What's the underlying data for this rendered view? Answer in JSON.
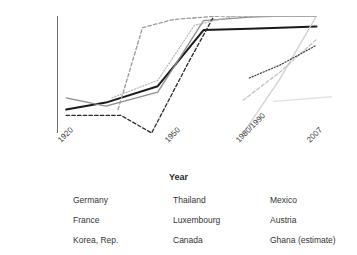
{
  "chart_data": {
    "type": "line",
    "title": "",
    "xlabel": "Year",
    "ylabel": "Coverage %",
    "ylim": [
      0,
      100
    ],
    "yticks": [
      0,
      20,
      40,
      60,
      80,
      100
    ],
    "xticks": [
      "1920",
      "1950",
      "1980/1990",
      "2007"
    ],
    "x": [
      1920,
      1930,
      1940,
      1950,
      1960,
      1970,
      1980,
      1990,
      2000,
      2007
    ],
    "grid": false,
    "legend_position": "bottom",
    "series": [
      {
        "name": "Germany",
        "style": "solid",
        "color": "#1a1a1a",
        "width": 2.0,
        "points": [
          [
            1920,
            20
          ],
          [
            1933,
            26
          ],
          [
            1950,
            40
          ],
          [
            1965,
            88
          ],
          [
            1980,
            89
          ],
          [
            1990,
            90
          ],
          [
            2002,
            91
          ]
        ]
      },
      {
        "name": "France",
        "style": "solid",
        "color": "#8c8c8c",
        "width": 1.3,
        "points": [
          [
            1920,
            30
          ],
          [
            1933,
            23
          ],
          [
            1950,
            35
          ],
          [
            1965,
            96
          ],
          [
            1980,
            99
          ],
          [
            1990,
            100
          ],
          [
            2002,
            100
          ]
        ]
      },
      {
        "name": "Korea, Rep.",
        "style": "solid",
        "color": "#cfcfcf",
        "width": 1.3,
        "points": [
          [
            1978,
            0
          ],
          [
            1990,
            46
          ],
          [
            2002,
            100
          ]
        ]
      },
      {
        "name": "Thailand",
        "style": "dashed",
        "color": "#2b2b2b",
        "width": 1.3,
        "points": [
          [
            1920,
            15
          ],
          [
            1938,
            15
          ],
          [
            1948,
            0
          ],
          [
            1960,
            60
          ],
          [
            1968,
            98
          ]
        ]
      },
      {
        "name": "Luxembourg",
        "style": "dashed",
        "color": "#9a9a9a",
        "width": 1.3,
        "points": [
          [
            1937,
            20
          ],
          [
            1945,
            90
          ],
          [
            1955,
            97
          ],
          [
            1970,
            100
          ],
          [
            2002,
            100
          ]
        ]
      },
      {
        "name": "Canada",
        "style": "dashed",
        "color": "#c2c2c2",
        "width": 1.3,
        "points": [
          [
            1978,
            28
          ],
          [
            1990,
            52
          ],
          [
            2002,
            80
          ]
        ]
      },
      {
        "name": "Mexico",
        "style": "dotted",
        "color": "#3a3a3a",
        "width": 1.2,
        "points": [
          [
            1980,
            47
          ],
          [
            1990,
            58
          ],
          [
            2002,
            75
          ]
        ]
      },
      {
        "name": "Austria",
        "style": "dotted",
        "color": "#b5b5b5",
        "width": 1.2,
        "points": [
          [
            1935,
            30
          ],
          [
            1950,
            45
          ],
          [
            1962,
            92
          ],
          [
            1975,
            100
          ],
          [
            2002,
            100
          ]
        ]
      },
      {
        "name": "Ghana (estimate)",
        "style": "solid",
        "color": "#e2e2e2",
        "width": 1.3,
        "points": [
          [
            1988,
            27
          ],
          [
            2007,
            31
          ]
        ]
      }
    ]
  },
  "axis": {
    "y_title": "Coverage %",
    "y_tick_labels": [
      "100",
      "80",
      "60",
      "40",
      "20",
      "0"
    ],
    "x_title": "Year",
    "x_tick_labels": [
      "1920",
      "1950",
      "1980/1990",
      "2007"
    ]
  },
  "legend": {
    "entries": [
      {
        "label": "Germany",
        "style": "solid",
        "color": "#1a1a1a",
        "width": 2.0
      },
      {
        "label": "Thailand",
        "style": "dashed",
        "color": "#2b2b2b",
        "width": 1.3
      },
      {
        "label": "Mexico",
        "style": "dotted",
        "color": "#3a3a3a",
        "width": 1.2
      },
      {
        "label": "France",
        "style": "solid",
        "color": "#8c8c8c",
        "width": 1.3
      },
      {
        "label": "Luxembourg",
        "style": "dashed",
        "color": "#9a9a9a",
        "width": 1.3
      },
      {
        "label": "Austria",
        "style": "dotted",
        "color": "#b5b5b5",
        "width": 1.2
      },
      {
        "label": "Korea, Rep.",
        "style": "solid",
        "color": "#cfcfcf",
        "width": 1.3
      },
      {
        "label": "Canada",
        "style": "dashed",
        "color": "#c2c2c2",
        "width": 1.3
      },
      {
        "label": "Ghana (estimate)",
        "style": "solid",
        "color": "#d8d8d8",
        "width": 1.3
      }
    ]
  },
  "colors": {
    "axis": "#6f6f6f",
    "text": "#3a3a3a",
    "background": "#ffffff"
  }
}
